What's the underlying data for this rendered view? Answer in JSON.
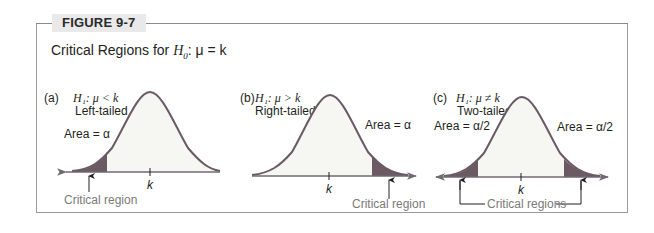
{
  "figure": {
    "label": "FIGURE 9-7",
    "title_prefix": "Critical Regions for ",
    "title_h0": "H",
    "title_h0_sub": "0",
    "title_suffix": ": μ = k"
  },
  "panels": [
    {
      "id": "a",
      "letter": "(a)",
      "hypothesis": "H₁:  μ < k",
      "tail": "Left-tailed",
      "area_label": "Area = α",
      "axis_label": "k",
      "critical_label": "Critical region"
    },
    {
      "id": "b",
      "letter": "(b)",
      "hypothesis": "H₁:  μ > k",
      "tail": "Right-tailed",
      "area_label": "Area = α",
      "axis_label": "k",
      "critical_label": "Critical region"
    },
    {
      "id": "c",
      "letter": "(c)",
      "hypothesis": "H₁:  μ ≠ k",
      "tail": "Two-tailed",
      "area_label_left": "Area = α/2",
      "area_label_right": "Area = α/2",
      "axis_label": "k",
      "critical_label": "Critical regions"
    }
  ],
  "colors": {
    "curve": "#6a5a66",
    "fill": "#f6f6f3",
    "shade": "#6b5a62",
    "axis": "#6f6a70",
    "frame": "#9a9a9a",
    "tab_bg": "#e9e9e9",
    "gray_text": "#7a7a7a"
  }
}
